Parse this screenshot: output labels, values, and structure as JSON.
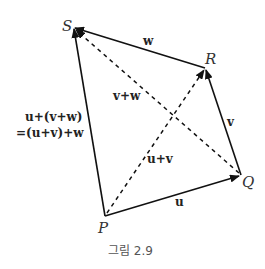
{
  "figure": {
    "caption": "그림 2.9",
    "points": {
      "P": {
        "label": "P",
        "x": 105,
        "y": 216
      },
      "Q": {
        "label": "Q",
        "x": 241,
        "y": 175
      },
      "R": {
        "label": "R",
        "x": 205,
        "y": 68
      },
      "S": {
        "label": "S",
        "x": 73,
        "y": 27
      }
    },
    "vectors": {
      "u": {
        "label": "u",
        "from": "P",
        "to": "Q",
        "style": "solid"
      },
      "v": {
        "label": "v",
        "from": "Q",
        "to": "R",
        "style": "solid"
      },
      "w": {
        "label": "w",
        "from": "R",
        "to": "S",
        "style": "solid"
      },
      "u_plus_v": {
        "label": "u+v",
        "from": "P",
        "to": "R",
        "style": "dashed"
      },
      "v_plus_w": {
        "label": "v+w",
        "from": "Q",
        "to": "S",
        "style": "dashed"
      },
      "sum": {
        "label_line1": "u+(v+w)",
        "label_line2": "=(u+v)+w",
        "from": "P",
        "to": "S",
        "style": "solid"
      }
    },
    "colors": {
      "line": "#111111",
      "text": "#222222",
      "caption": "#555555"
    }
  }
}
